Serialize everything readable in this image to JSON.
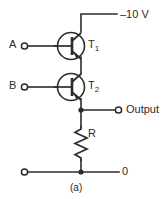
{
  "figure": {
    "caption": "(a)",
    "type": "transistor-logic-circuit-schematic"
  },
  "labels": {
    "supply": "–10 V",
    "input_a": "A",
    "input_b": "B",
    "transistor_1": "T",
    "transistor_1_sub": "1",
    "transistor_2": "T",
    "transistor_2_sub": "2",
    "output": "Output",
    "resistor": "R",
    "ground": "0"
  },
  "colors": {
    "line": "#2b2b2b",
    "background": "#ffffff"
  },
  "components": {
    "transistors": [
      {
        "name": "T1",
        "kind": "pnp",
        "input": "A",
        "label": "T₁"
      },
      {
        "name": "T2",
        "kind": "pnp",
        "input": "B",
        "label": "T₂"
      }
    ],
    "resistor": {
      "name": "R",
      "style": "zigzag",
      "label": "R"
    },
    "supply_rail": {
      "label": "–10 V",
      "value": "-10 V"
    },
    "terminals": [
      {
        "name": "A",
        "style": "open-circle"
      },
      {
        "name": "B",
        "style": "open-circle"
      },
      {
        "name": "Output",
        "style": "open-circle"
      },
      {
        "name": "ground-left",
        "style": "open-circle"
      }
    ],
    "junction_nodes": 2
  }
}
